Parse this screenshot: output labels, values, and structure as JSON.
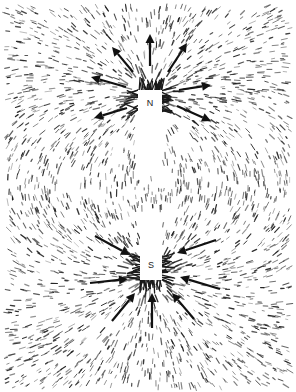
{
  "figure": {
    "background": "#ffffff",
    "ink": "#1a1a1a",
    "field_area": {
      "x": 6,
      "y": 6,
      "w": 284,
      "h": 382
    },
    "magnet_north": {
      "x": 138,
      "y": 90,
      "w": 24,
      "h": 86,
      "label": "N",
      "label_pos": [
        150,
        103
      ]
    },
    "magnet_south": {
      "x": 140,
      "y": 214,
      "w": 22,
      "h": 66,
      "label": "S",
      "label_pos": [
        151,
        265
      ]
    },
    "poles": {
      "north": [
        150,
        95
      ],
      "south": [
        151,
        275
      ]
    },
    "arrows_north": [
      {
        "from": [
          150,
          66
        ],
        "to": [
          150,
          34
        ]
      },
      {
        "from": [
          133,
          72
        ],
        "to": [
          112,
          47
        ]
      },
      {
        "from": [
          168,
          72
        ],
        "to": [
          187,
          43
        ]
      },
      {
        "from": [
          126,
          87
        ],
        "to": [
          91,
          77
        ]
      },
      {
        "from": [
          179,
          90
        ],
        "to": [
          211,
          85
        ]
      },
      {
        "from": [
          127,
          108
        ],
        "to": [
          94,
          118
        ]
      },
      {
        "from": [
          177,
          106
        ],
        "to": [
          211,
          121
        ]
      }
    ],
    "arrows_south": [
      {
        "from": [
          95,
          236
        ],
        "to": [
          130,
          255
        ]
      },
      {
        "from": [
          216,
          240
        ],
        "to": [
          177,
          253
        ]
      },
      {
        "from": [
          90,
          283
        ],
        "to": [
          128,
          279
        ]
      },
      {
        "from": [
          220,
          289
        ],
        "to": [
          180,
          277
        ]
      },
      {
        "from": [
          112,
          321
        ],
        "to": [
          135,
          293
        ]
      },
      {
        "from": [
          194,
          319
        ],
        "to": [
          172,
          293
        ]
      },
      {
        "from": [
          152,
          328
        ],
        "to": [
          152,
          293
        ]
      }
    ],
    "filing_count": 2600,
    "seed": 7
  }
}
